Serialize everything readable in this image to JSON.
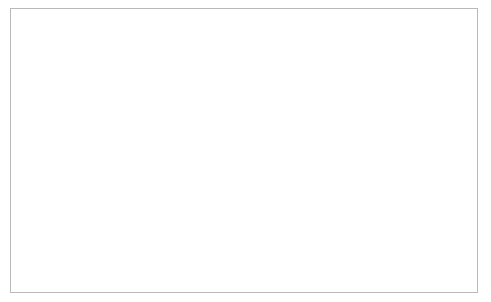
{
  "chart_data": {
    "type": "line",
    "title": "",
    "xlabel": "",
    "ylabel": "",
    "ylim": [
      0,
      120000
    ],
    "ytick_values": [
      0,
      20000,
      40000,
      60000,
      80000,
      100000,
      120000
    ],
    "ytick_labels": [
      "0",
      "20000",
      "40000",
      "60000",
      "80000",
      "100000",
      "120000"
    ],
    "grid": false,
    "legend_position": "bottom",
    "x": [
      1995,
      1996,
      1997,
      1998,
      1999,
      2000,
      2001,
      2002,
      2003,
      2004,
      2005,
      2006,
      2007,
      2008,
      2009,
      2010,
      2011,
      2012,
      2013,
      2014
    ],
    "categories": [
      "1995",
      "1996",
      "1997",
      "1998",
      "1999",
      "2000",
      "2001",
      "2002",
      "2003",
      "2004",
      "2005",
      "2006",
      "2007",
      "2008",
      "2009",
      "2010",
      "2011",
      "2012",
      "2013",
      "2014"
    ],
    "series": [
      {
        "name": "Croatia",
        "marker": "open-circle",
        "line_style": "solid",
        "color": "#000000",
        "values": [
          1500,
          1400,
          1300,
          1500,
          1800,
          2000,
          20000,
          45800,
          60100,
          54000,
          60500,
          65700,
          102200,
          75300,
          40600,
          13200,
          21500,
          29300,
          29200,
          24600
        ]
      },
      {
        "name": "Czechia",
        "marker": "open-diamond",
        "line_style": "solid",
        "color": "#000000",
        "values": [
          4300,
          4200,
          4000,
          3600,
          3000,
          2700,
          2900,
          3100,
          3400,
          3800,
          4200,
          4600,
          6000,
          8000,
          10200,
          12100,
          13500,
          16000,
          17000,
          55200
        ]
      },
      {
        "name": "Estonia",
        "marker": "open-triangle",
        "line_style": "solid",
        "color": "#000000",
        "values": [
          300,
          400,
          500,
          600,
          700,
          800,
          900,
          1100,
          1300,
          1600,
          1900,
          2300,
          2800,
          3200,
          3000,
          2800,
          3000,
          3300,
          3600,
          3900
        ]
      },
      {
        "name": "Hungary",
        "marker": "open-circle",
        "line_style": "dashed",
        "color": "#000000",
        "values": [
          13300,
          13400,
          13000,
          13600,
          15200,
          16600,
          16800,
          15600,
          16800,
          18000,
          20200,
          19800,
          18400,
          18000,
          17400,
          16700,
          17400,
          20600,
          20500,
          35800
        ]
      },
      {
        "name": "Latvia",
        "marker": "filled-triangle",
        "line_style": "dotted",
        "color": "#000000",
        "values": [
          2200,
          1600,
          1400,
          1300,
          1200,
          1300,
          1400,
          1500,
          1600,
          1800,
          2000,
          2300,
          2600,
          2900,
          2700,
          2500,
          2600,
          2800,
          3000,
          3200
        ]
      },
      {
        "name": "Lithuania",
        "marker": "filled-square",
        "line_style": "dashdot",
        "color": "#000000",
        "values": [
          900,
          1000,
          1000,
          900,
          800,
          800,
          900,
          1000,
          1100,
          1200,
          1400,
          1600,
          1900,
          2200,
          2100,
          2000,
          2200,
          2400,
          2600,
          2800
        ]
      },
      {
        "name": "Poland",
        "marker": "filled-circle",
        "line_style": "dashdot",
        "color": "#000000",
        "values": [
          600,
          700,
          800,
          900,
          1000,
          1100,
          1300,
          1500,
          1800,
          2200,
          2800,
          3700,
          5000,
          7400,
          11900,
          12400,
          13800,
          22200,
          42500,
          82100
        ]
      },
      {
        "name": "Slovakia",
        "marker": "filled-circle",
        "line_style": "dotted",
        "color": "#000000",
        "values": [
          5100,
          4900,
          4600,
          4200,
          3900,
          4000,
          4400,
          4600,
          4800,
          5000,
          5400,
          5800,
          6200,
          6600,
          6400,
          6100,
          6000,
          6100,
          6200,
          6300
        ]
      },
      {
        "name": "Slovenia",
        "marker": "filled-square",
        "line_style": "solid",
        "color": "#000000",
        "values": [
          7700,
          7800,
          7400,
          6600,
          5800,
          5400,
          5700,
          6200,
          6900,
          7800,
          9400,
          11200,
          15300,
          25000,
          28200,
          28100,
          24300,
          18700,
          20500,
          20400
        ]
      }
    ]
  }
}
